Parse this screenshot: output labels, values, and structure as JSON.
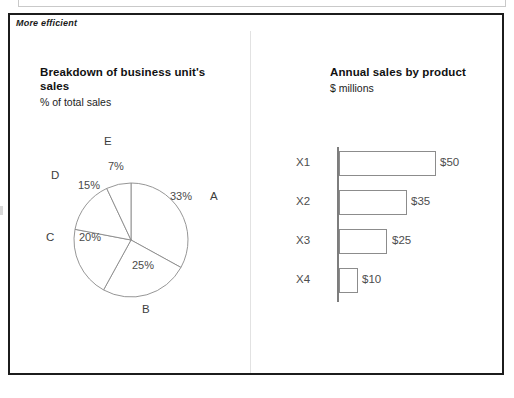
{
  "slide": {
    "corner_label": "More efficient"
  },
  "left_panel": {
    "title": "Breakdown of business unit's sales",
    "subtitle": "% of total sales"
  },
  "right_panel": {
    "title": "Annual sales by product",
    "subtitle": "$ millions"
  },
  "chart_data": [
    {
      "type": "pie",
      "title": "Breakdown of business unit's sales",
      "subtitle": "% of total sales",
      "unit": "% of total sales",
      "categories": [
        "A",
        "B",
        "C",
        "D",
        "E"
      ],
      "values": [
        33,
        25,
        20,
        15,
        7
      ],
      "labels": [
        "33%",
        "25%",
        "20%",
        "15%",
        "7%"
      ],
      "start_angle_deg": 0,
      "direction": "clockwise",
      "slice_fill": "#ffffff",
      "slice_stroke": "#8a8a8a",
      "legend": "none",
      "grid": false
    },
    {
      "type": "bar",
      "orientation": "horizontal",
      "title": "Annual sales by product",
      "subtitle": "$ millions",
      "xlabel": "",
      "ylabel": "",
      "unit": "$ millions",
      "categories": [
        "X1",
        "X2",
        "X3",
        "X4"
      ],
      "values": [
        50,
        35,
        25,
        10
      ],
      "value_labels": [
        "$50",
        "$35",
        "$25",
        "$10"
      ],
      "xlim": [
        0,
        55
      ],
      "grid": false,
      "legend": "none",
      "bar_fill": "#ffffff",
      "bar_stroke": "#8c8c8c",
      "axis_color": "#7d7d7d"
    }
  ],
  "pie_geometry": {
    "slice_labels": [
      {
        "text": "33%",
        "left": 138,
        "top": 55
      },
      {
        "text": "25%",
        "left": 100,
        "top": 124
      },
      {
        "text": "20%",
        "left": 47,
        "top": 96
      },
      {
        "text": "15%",
        "left": 46,
        "top": 44
      },
      {
        "text": "7%",
        "left": 76,
        "top": 25
      }
    ],
    "category_labels": [
      {
        "text": "A",
        "left": 178,
        "top": 55
      },
      {
        "text": "B",
        "left": 110,
        "top": 168
      },
      {
        "text": "C",
        "left": 14,
        "top": 96
      },
      {
        "text": "D",
        "left": 19,
        "top": 34
      },
      {
        "text": "E",
        "left": 72,
        "top": 0
      }
    ]
  },
  "bar_geometry": {
    "rows": [
      {
        "category": "X1",
        "value_label": "$50",
        "bar_px": 97,
        "value_left": 172,
        "top": 0
      },
      {
        "category": "X2",
        "value_label": "$35",
        "bar_px": 68,
        "value_left": 143,
        "top": 39
      },
      {
        "category": "X3",
        "value_label": "$25",
        "bar_px": 48,
        "value_left": 124,
        "top": 78
      },
      {
        "category": "X4",
        "value_label": "$10",
        "bar_px": 19,
        "value_left": 94,
        "top": 117
      }
    ]
  },
  "colors": {
    "panel_border": "#1c1c1c",
    "divider": "#e2e2e2",
    "text": "#1a1a1a",
    "muted_text": "#4d4d4d",
    "background": "#ffffff"
  }
}
